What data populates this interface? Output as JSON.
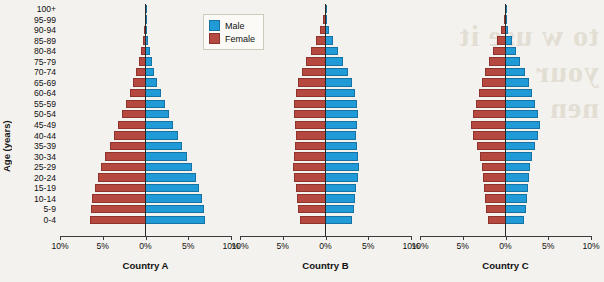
{
  "chart_data": {
    "type": "bar",
    "subtype": "population-pyramid",
    "title": "",
    "xlabel": "",
    "ylabel": "Age (years)",
    "xlim": [
      -10,
      10
    ],
    "xticks": [
      "10%",
      "5%",
      "0%",
      "5%",
      "10%"
    ],
    "xtick_values": [
      -10,
      -5,
      0,
      5,
      10
    ],
    "grid": false,
    "legend_position": "top-center",
    "categories": [
      "100+",
      "95-99",
      "90-94",
      "85-89",
      "80-84",
      "75-79",
      "70-74",
      "65-69",
      "60-64",
      "55-59",
      "50-54",
      "45-49",
      "40-44",
      "35-39",
      "30-34",
      "25-29",
      "20-24",
      "15-19",
      "10-14",
      "5-9",
      "0-4"
    ],
    "legend": [
      {
        "name": "Male",
        "color": "#219bd8"
      },
      {
        "name": "Female",
        "color": "#b5493f"
      }
    ],
    "panels": [
      {
        "title": "Country A",
        "series": [
          {
            "name": "Female",
            "values": [
              0.05,
              0.1,
              0.2,
              0.35,
              0.55,
              0.8,
              1.1,
              1.45,
              1.85,
              2.3,
              2.75,
              3.2,
              3.7,
              4.2,
              4.7,
              5.2,
              5.6,
              5.9,
              6.2,
              6.4,
              6.5
            ]
          },
          {
            "name": "Male",
            "values": [
              0.04,
              0.08,
              0.18,
              0.32,
              0.5,
              0.75,
              1.05,
              1.4,
              1.8,
              2.25,
              2.7,
              3.2,
              3.75,
              4.3,
              4.85,
              5.4,
              5.85,
              6.2,
              6.55,
              6.8,
              7.0
            ]
          }
        ]
      },
      {
        "title": "Country B",
        "series": [
          {
            "name": "Female",
            "values": [
              0.05,
              0.25,
              0.6,
              1.1,
              1.7,
              2.3,
              2.8,
              3.2,
              3.5,
              3.65,
              3.7,
              3.6,
              3.5,
              3.55,
              3.7,
              3.8,
              3.7,
              3.5,
              3.35,
              3.2,
              2.95
            ]
          },
          {
            "name": "Male",
            "values": [
              0.03,
              0.15,
              0.4,
              0.85,
              1.45,
              2.1,
              2.65,
              3.1,
              3.45,
              3.65,
              3.75,
              3.7,
              3.6,
              3.65,
              3.8,
              3.9,
              3.8,
              3.6,
              3.45,
              3.3,
              3.1
            ]
          }
        ]
      },
      {
        "title": "Country C",
        "series": [
          {
            "name": "Female",
            "values": [
              0.05,
              0.2,
              0.5,
              0.95,
              1.45,
              1.95,
              2.4,
              2.8,
              3.15,
              3.5,
              3.8,
              4.0,
              3.75,
              3.35,
              3.0,
              2.8,
              2.65,
              2.5,
              2.4,
              2.3,
              2.1
            ]
          },
          {
            "name": "Male",
            "values": [
              0.03,
              0.12,
              0.35,
              0.75,
              1.25,
              1.75,
              2.25,
              2.7,
              3.1,
              3.5,
              3.85,
              4.05,
              3.85,
              3.45,
              3.1,
              2.9,
              2.75,
              2.6,
              2.5,
              2.4,
              2.2
            ]
          }
        ]
      }
    ]
  },
  "watermark": {
    "text": "to w use it\nyour\nnen"
  }
}
